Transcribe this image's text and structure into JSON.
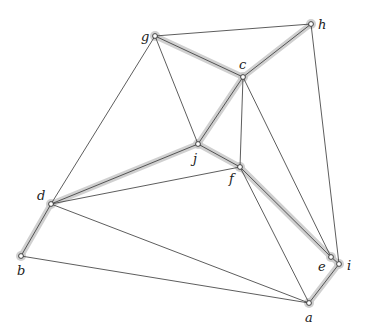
{
  "diagram": {
    "type": "graph",
    "colors": {
      "edge": "#333333",
      "highlight": "#c8c8c8",
      "node_fill": "#ffffff",
      "label": "#222222"
    },
    "nodes": [
      {
        "id": "a",
        "label": "a",
        "x": 309,
        "y": 303,
        "lx": 305,
        "ly": 322
      },
      {
        "id": "b",
        "label": "b",
        "x": 21,
        "y": 256,
        "lx": 17,
        "ly": 275
      },
      {
        "id": "c",
        "label": "c",
        "x": 243,
        "y": 77,
        "lx": 239,
        "ly": 69
      },
      {
        "id": "d",
        "label": "d",
        "x": 51,
        "y": 204,
        "lx": 37,
        "ly": 200
      },
      {
        "id": "e",
        "label": "e",
        "x": 331,
        "y": 257,
        "lx": 318,
        "ly": 271
      },
      {
        "id": "f",
        "label": "f",
        "x": 240,
        "y": 167,
        "lx": 229,
        "ly": 183
      },
      {
        "id": "g",
        "label": "g",
        "x": 155,
        "y": 36,
        "lx": 141,
        "ly": 41
      },
      {
        "id": "h",
        "label": "h",
        "x": 311,
        "y": 24,
        "lx": 318,
        "ly": 29
      },
      {
        "id": "i",
        "label": "i",
        "x": 339,
        "y": 264,
        "lx": 347,
        "ly": 270
      },
      {
        "id": "j",
        "label": "j",
        "x": 198,
        "y": 144,
        "lx": 193,
        "ly": 163
      }
    ],
    "edges": [
      {
        "from": "g",
        "to": "c",
        "highlighted": true
      },
      {
        "from": "c",
        "to": "h",
        "highlighted": true
      },
      {
        "from": "c",
        "to": "j",
        "highlighted": true
      },
      {
        "from": "j",
        "to": "d",
        "highlighted": true
      },
      {
        "from": "d",
        "to": "b",
        "highlighted": true
      },
      {
        "from": "j",
        "to": "f",
        "highlighted": true
      },
      {
        "from": "f",
        "to": "e",
        "highlighted": true
      },
      {
        "from": "e",
        "to": "i",
        "highlighted": true
      },
      {
        "from": "i",
        "to": "a",
        "highlighted": true
      },
      {
        "from": "g",
        "to": "h",
        "highlighted": false
      },
      {
        "from": "g",
        "to": "d",
        "highlighted": false
      },
      {
        "from": "g",
        "to": "j",
        "highlighted": false
      },
      {
        "from": "c",
        "to": "f",
        "highlighted": false
      },
      {
        "from": "c",
        "to": "e",
        "highlighted": false
      },
      {
        "from": "h",
        "to": "i",
        "highlighted": false
      },
      {
        "from": "d",
        "to": "f",
        "highlighted": false
      },
      {
        "from": "d",
        "to": "a",
        "highlighted": false
      },
      {
        "from": "b",
        "to": "a",
        "highlighted": false
      },
      {
        "from": "f",
        "to": "a",
        "highlighted": false
      }
    ]
  }
}
